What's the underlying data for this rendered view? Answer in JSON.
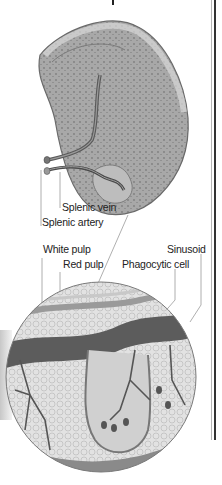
{
  "figure": {
    "colors": {
      "background": "#ffffff",
      "tissue_dark": "#6a6a6a",
      "tissue_mid": "#9c9c9c",
      "tissue_light": "#cfcfcf",
      "vessel": "#4a4a4a",
      "leader_line": "#9a9a9a",
      "text": "#222222"
    }
  },
  "labels": {
    "splenic_vein": "Splenic vein",
    "splenic_artery": "Splenic artery",
    "white_pulp": "White pulp",
    "red_pulp": "Red pulp",
    "sinusoid": "Sinusoid",
    "phagocytic_cell": "Phagocytic cell"
  }
}
